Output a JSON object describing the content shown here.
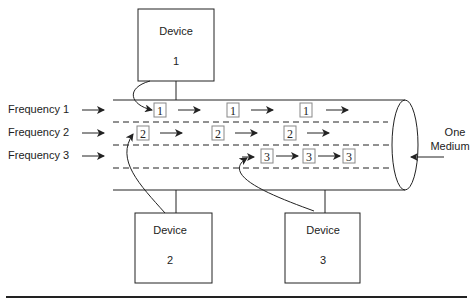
{
  "diagram": {
    "devices": [
      {
        "label": "Device",
        "number": "1"
      },
      {
        "label": "Device",
        "number": "2"
      },
      {
        "label": "Device",
        "number": "3"
      }
    ],
    "frequencies": [
      {
        "label": "Frequency 1",
        "packet": "1",
        "packet_count": 3
      },
      {
        "label": "Frequency 2",
        "packet": "2",
        "packet_count": 3
      },
      {
        "label": "Frequency 3",
        "packet": "3",
        "packet_count": 3
      }
    ],
    "medium_label_line1": "One",
    "medium_label_line2": "Medium",
    "colors": {
      "stroke": "#222222",
      "background": "#ffffff",
      "packet_border": "#888888"
    }
  }
}
